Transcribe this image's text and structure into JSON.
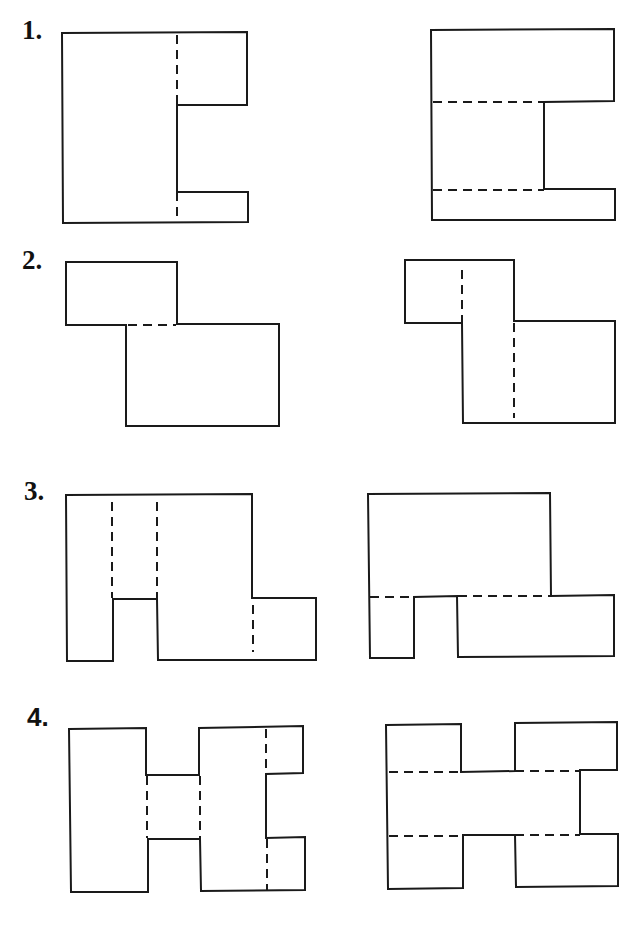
{
  "problems": [
    {
      "number": "1.",
      "label_pos": [
        22,
        17
      ],
      "figures": [
        {
          "name": "problem-1-left-figure",
          "outline": [
            [
              62,
              33
            ],
            [
              247,
              32
            ],
            [
              247,
              105
            ],
            [
              177,
              105
            ],
            [
              177,
              192
            ],
            [
              248,
              192
            ],
            [
              248,
              222
            ],
            [
              63,
              223
            ]
          ],
          "hidden_lines": [
            [
              [
                177,
                35
              ],
              [
                177,
                105
              ]
            ],
            [
              [
                177,
                192
              ],
              [
                177,
                221
              ]
            ]
          ]
        },
        {
          "name": "problem-1-right-figure",
          "outline": [
            [
              431,
              30
            ],
            [
              614,
              29
            ],
            [
              614,
              101
            ],
            [
              544,
              102
            ],
            [
              544,
              189
            ],
            [
              615,
              189
            ],
            [
              615,
              220
            ],
            [
              432,
              220
            ]
          ],
          "hidden_lines": [
            [
              [
                433,
                102
              ],
              [
                544,
                102
              ]
            ],
            [
              [
                433,
                190
              ],
              [
                544,
                190
              ]
            ]
          ]
        }
      ]
    },
    {
      "number": "2.",
      "label_pos": [
        22,
        247
      ],
      "figures": [
        {
          "name": "problem-2-left-figure",
          "outline": [
            [
              66,
              262
            ],
            [
              177,
              262
            ],
            [
              177,
              324
            ],
            [
              279,
              324
            ],
            [
              279,
              426
            ],
            [
              126,
              426
            ],
            [
              126,
              325
            ],
            [
              66,
              325
            ]
          ],
          "hidden_lines": [
            [
              [
                128,
                325
              ],
              [
                176,
                325
              ]
            ]
          ]
        },
        {
          "name": "problem-2-right-figure",
          "outline": [
            [
              405,
              260
            ],
            [
              514,
              260
            ],
            [
              514,
              321
            ],
            [
              615,
              321
            ],
            [
              615,
              423
            ],
            [
              463,
              423
            ],
            [
              462,
              323
            ],
            [
              405,
              323
            ]
          ],
          "hidden_lines": [
            [
              [
                462,
                270
              ],
              [
                462,
                322
              ]
            ],
            [
              [
                514,
                323
              ],
              [
                514,
                418
              ]
            ]
          ]
        }
      ]
    },
    {
      "number": "3.",
      "label_pos": [
        24,
        478
      ],
      "figures": [
        {
          "name": "problem-3-left-figure",
          "outline": [
            [
              66,
              495
            ],
            [
              252,
              494
            ],
            [
              252,
              598
            ],
            [
              316,
              598
            ],
            [
              316,
              660
            ],
            [
              158,
              660
            ],
            [
              157,
              599
            ],
            [
              113,
              599
            ],
            [
              113,
              661
            ],
            [
              67,
              661
            ]
          ],
          "hidden_lines": [
            [
              [
                112,
                502
              ],
              [
                112,
                598
              ]
            ],
            [
              [
                157,
                502
              ],
              [
                157,
                598
              ]
            ],
            [
              [
                253,
                605
              ],
              [
                253,
                652
              ]
            ]
          ]
        },
        {
          "name": "problem-3-right-figure",
          "outline": [
            [
              368,
              494
            ],
            [
              550,
              493
            ],
            [
              551,
              596
            ],
            [
              614,
              595
            ],
            [
              614,
              656
            ],
            [
              458,
              657
            ],
            [
              457,
              596
            ],
            [
              414,
              597
            ],
            [
              414,
              658
            ],
            [
              370,
              658
            ]
          ],
          "hidden_lines": [
            [
              [
                370,
                597
              ],
              [
                414,
                597
              ]
            ],
            [
              [
                458,
                596
              ],
              [
                550,
                596
              ]
            ]
          ]
        }
      ]
    },
    {
      "number": "4.",
      "label_pos": [
        27,
        704
      ],
      "figures": [
        {
          "name": "problem-4-left-figure",
          "outline": [
            [
              69,
              729
            ],
            [
              146,
              728
            ],
            [
              146,
              775
            ],
            [
              199,
              775
            ],
            [
              199,
              728
            ],
            [
              303,
              726
            ],
            [
              303,
              773
            ],
            [
              266,
              774
            ],
            [
              266,
              838
            ],
            [
              305,
              837
            ],
            [
              305,
              890
            ],
            [
              201,
              891
            ],
            [
              200,
              839
            ],
            [
              148,
              839
            ],
            [
              148,
              892
            ],
            [
              71,
              892
            ]
          ],
          "hidden_lines": [
            [
              [
                147,
                776
              ],
              [
                147,
                838
              ]
            ],
            [
              [
                200,
                776
              ],
              [
                200,
                838
              ]
            ],
            [
              [
                266,
                729
              ],
              [
                266,
                773
              ]
            ],
            [
              [
                267,
                839
              ],
              [
                267,
                890
              ]
            ]
          ]
        },
        {
          "name": "problem-4-right-figure",
          "outline": [
            [
              386,
              725
            ],
            [
              461,
              724
            ],
            [
              461,
              772
            ],
            [
              515,
              771
            ],
            [
              515,
              723
            ],
            [
              617,
              722
            ],
            [
              617,
              770
            ],
            [
              580,
              770
            ],
            [
              580,
              834
            ],
            [
              618,
              834
            ],
            [
              618,
              886
            ],
            [
              516,
              887
            ],
            [
              515,
              835
            ],
            [
              463,
              835
            ],
            [
              463,
              888
            ],
            [
              388,
              889
            ]
          ],
          "hidden_lines": [
            [
              [
                389,
                772
              ],
              [
                461,
                772
              ]
            ],
            [
              [
                515,
                771
              ],
              [
                580,
                771
              ]
            ],
            [
              [
                389,
                836
              ],
              [
                463,
                836
              ]
            ],
            [
              [
                515,
                835
              ],
              [
                580,
                835
              ]
            ]
          ]
        }
      ]
    }
  ]
}
